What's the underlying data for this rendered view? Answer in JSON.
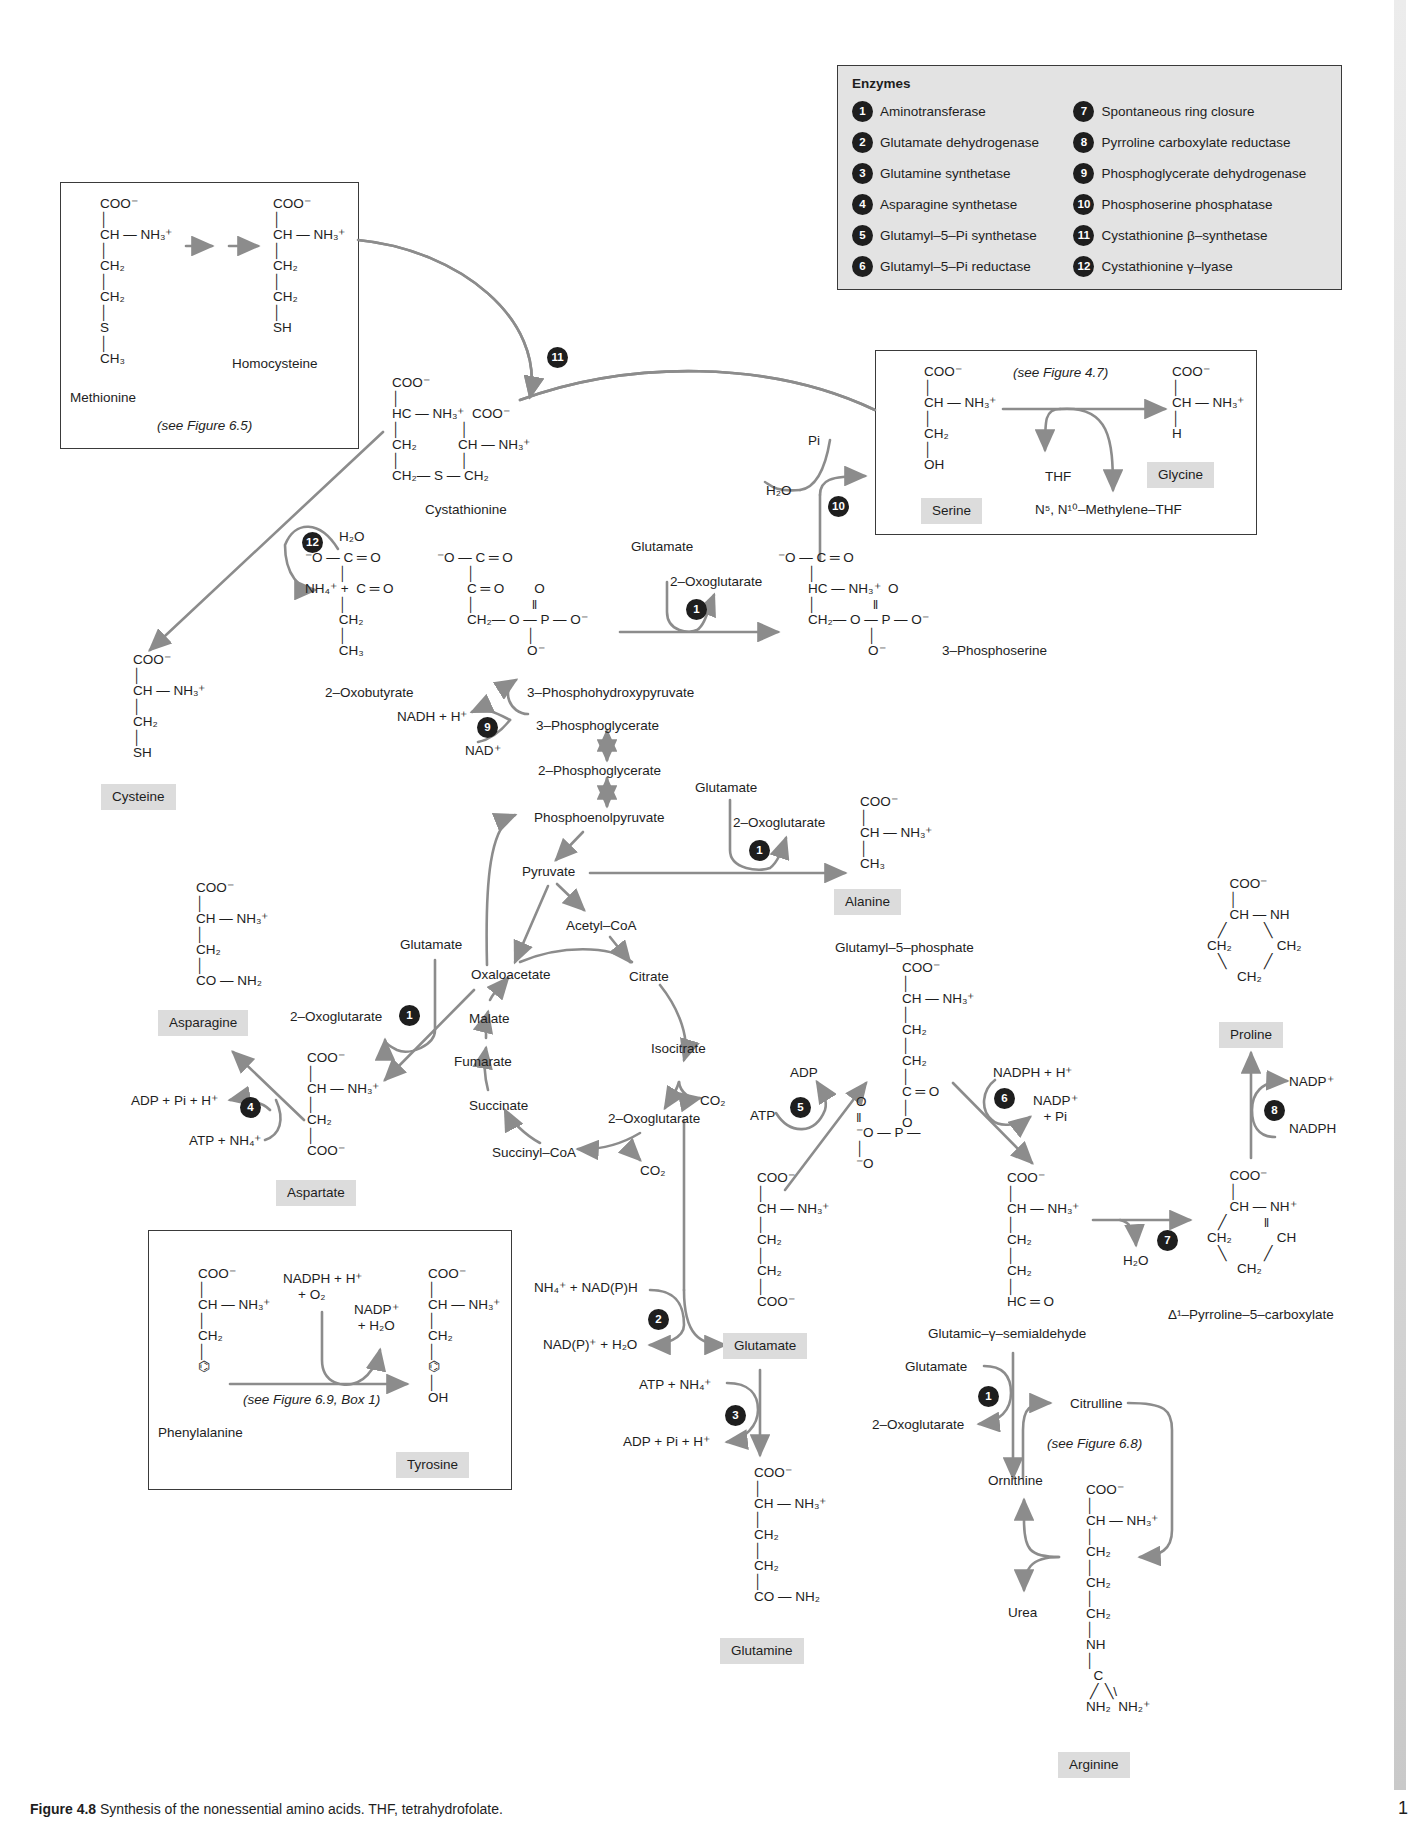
{
  "legend": {
    "title": "Enzymes",
    "items": [
      {
        "n": "1",
        "name": "Aminotransferase"
      },
      {
        "n": "2",
        "name": "Glutamate dehydrogenase"
      },
      {
        "n": "3",
        "name": "Glutamine synthetase"
      },
      {
        "n": "4",
        "name": "Asparagine synthetase"
      },
      {
        "n": "5",
        "name": "Glutamyl–5–Pi synthetase"
      },
      {
        "n": "6",
        "name": "Glutamyl–5–Pi reductase"
      },
      {
        "n": "7",
        "name": "Spontaneous ring closure"
      },
      {
        "n": "8",
        "name": "Pyrroline carboxylate reductase"
      },
      {
        "n": "9",
        "name": "Phosphoglycerate dehydrogenase"
      },
      {
        "n": "10",
        "name": "Phosphoserine phosphatase"
      },
      {
        "n": "11",
        "name": "Cystathionine β–synthetase"
      },
      {
        "n": "12",
        "name": "Cystathionine γ–lyase"
      }
    ]
  },
  "colors": {
    "arrow": "#8c8c8c",
    "badge": "#1e1e1e",
    "label_bg": "#dcdcdc",
    "legend_bg": "#e3e3e3",
    "sidebar": "#d0d0d0"
  },
  "boxes": {
    "methionine": {
      "ref": "(see Figure 6.5)"
    },
    "serine": {
      "ref": "(see Figure 4.7)"
    },
    "tyrosine": {
      "ref": "(see Figure 6.9, Box 1)"
    }
  },
  "structures": {
    "methionine": "COO⁻\n│\nCH — NH₃⁺\n│\nCH₂\n│\nCH₂\n│\nS\n│\nCH₃",
    "homocysteine": "COO⁻\n│\nCH — NH₃⁺\n│\nCH₂\n│\nCH₂\n│\nSH",
    "cystathionine": "COO⁻\n│\nHC — NH₃⁺  COO⁻\n│                │\nCH₂           CH — NH₃⁺\n│                │\nCH₂— S — CH₂",
    "serine": "COO⁻\n│\nCH — NH₃⁺\n│\nCH₂\n│\nOH",
    "glycine": "COO⁻\n│\nCH — NH₃⁺\n│\nH",
    "oxobutyrate": "⁻O — C ═ O\n         │\nNH₄⁺ +  C ═ O\n         │\n         CH₂\n         │\n         CH₃",
    "phosphohydroxypyruvate": "⁻O — C ═ O\n        │\n        C ═ O        O\n        │               ‖\n        CH₂— O — P — O⁻\n                        │\n                        O⁻",
    "phosphoserine": "⁻O — C ═ O\n        │\n        HC — NH₃⁺  O\n        │               ‖\n        CH₂— O — P — O⁻\n                        │\n                        O⁻",
    "cysteine": "COO⁻\n│\nCH — NH₃⁺\n│\nCH₂\n│\nSH",
    "alanine": "COO⁻\n│\nCH — NH₃⁺\n│\nCH₃",
    "asparagine": "COO⁻\n│\nCH — NH₃⁺\n│\nCH₂\n│\nCO — NH₂",
    "aspartate": "COO⁻\n│\nCH — NH₃⁺\n│\nCH₂\n│\nCOO⁻",
    "glutamyl5p": "COO⁻\n│\nCH — NH₃⁺\n│\nCH₂\n│\nCH₂\n│\nC ═ O\n│\nO",
    "glutamyl5p_phosphate": "O\n‖\n⁻O — P —\n│\n⁻O",
    "glutamate": "COO⁻\n│\nCH — NH₃⁺\n│\nCH₂\n│\nCH₂\n│\nCOO⁻",
    "semialdehyde": "COO⁻\n│\nCH — NH₃⁺\n│\nCH₂\n│\nCH₂\n│\nHC ═ O",
    "proline": "      COO⁻\n      │\n      CH — NH\n   ╱          ╲\nCH₂            CH₂\n   ╲          ╱\n        CH₂",
    "p5c": "      COO⁻\n      │\n      CH — NH⁺\n   ╱          ‖\nCH₂            CH\n   ╲          ╱\n        CH₂",
    "glutamine": "COO⁻\n│\nCH — NH₃⁺\n│\nCH₂\n│\nCH₂\n│\nCO — NH₂",
    "arginine": "COO⁻\n│\nCH — NH₃⁺\n│\nCH₂\n│\nCH₂\n│\nCH₂\n│\nNH\n│\n  C\n ╱  ╲\\\nNH₂  NH₂⁺",
    "phenylalanine": "COO⁻\n│\nCH — NH₃⁺\n│\nCH₂\n│\n⌬",
    "tyrosine": "COO⁻\n│\nCH — NH₃⁺\n│\nCH₂\n│\n⌬\n│\nOH"
  },
  "labels": {
    "methionine": "Methionine",
    "homocysteine": "Homocysteine",
    "cystathionine": "Cystathionine",
    "serine": "Serine",
    "glycine": "Glycine",
    "thf": "THF",
    "methylene_thf": "N⁵, N¹⁰–Methylene–THF",
    "pi": "Pi",
    "h2o_10": "H₂O",
    "glutamate_a": "Glutamate",
    "oxoglutarate_a": "2–Oxoglutarate",
    "phosphoserine": "3–Phosphoserine",
    "h2o_12": "H₂O",
    "oxobutyrate": "2–Oxobutyrate",
    "phosphohydroxypyruvate": "3–Phosphohydroxypyruvate",
    "nadh": "NADH + H⁺",
    "nad": "NAD⁺",
    "phosphoglycerate3": "3–Phosphoglycerate",
    "phosphoglycerate2": "2–Phosphoglycerate",
    "pep": "Phosphoenolpyruvate",
    "pyruvate": "Pyruvate",
    "glutamate_b": "Glutamate",
    "oxoglutarate_b": "2–Oxoglutarate",
    "alanine": "Alanine",
    "cysteine": "Cysteine",
    "acetylcoa": "Acetyl–CoA",
    "citrate": "Citrate",
    "oxaloacetate": "Oxaloacetate",
    "malate": "Malate",
    "fumarate": "Fumarate",
    "succinate": "Succinate",
    "succinylcoa": "Succinyl–CoA",
    "isocitrate": "Isocitrate",
    "co2_a": "CO₂",
    "oxoglutarate_tca": "2–Oxoglutarate",
    "co2_b": "CO₂",
    "glutamate_c": "Glutamate",
    "oxoglutarate_c": "2–Oxoglutarate",
    "asparagine": "Asparagine",
    "aspartate": "Aspartate",
    "adp_pi_h": "ADP + Pi + H⁺",
    "atp_nh4": "ATP + NH₄⁺",
    "glutamyl5p": "Glutamyl–5–phosphate",
    "adp": "ADP",
    "atp": "ATP",
    "nadph_h": "NADPH + H⁺",
    "nadp_pi": "NADP⁺\n+ Pi",
    "nh4_nadph": "NH₄⁺ + NAD(P)H",
    "nadp_h2o": "NAD(P)⁺ + H₂O",
    "glutamate_main": "Glutamate",
    "atp_nh4_3": "ATP + NH₄⁺",
    "adp_pi_h_3": "ADP + Pi + H⁺",
    "glutamine": "Glutamine",
    "semialdehyde": "Glutamic–γ–semialdehyde",
    "h2o_7": "H₂O",
    "p5c": "Δ¹–Pyrroline–5–carboxylate",
    "proline": "Proline",
    "nadp_8": "NADP⁺",
    "nadph_8": "NADPH",
    "glutamate_d": "Glutamate",
    "oxoglutarate_d": "2–Oxoglutarate",
    "citrulline": "Citrulline",
    "see68": "(see Figure 6.8)",
    "ornithine": "Ornithine",
    "urea": "Urea",
    "arginine": "Arginine",
    "phenylalanine": "Phenylalanine",
    "tyrosine": "Tyrosine",
    "nadph_o2": "NADPH + H⁺\n    + O₂",
    "nadp_h2o_tyr": "NADP⁺\n+ H₂O"
  },
  "caption": {
    "fig": "Figure 4.8",
    "text": " Synthesis of the nonessential amino acids. THF, tetrahydrofolate."
  },
  "page_number": "1"
}
